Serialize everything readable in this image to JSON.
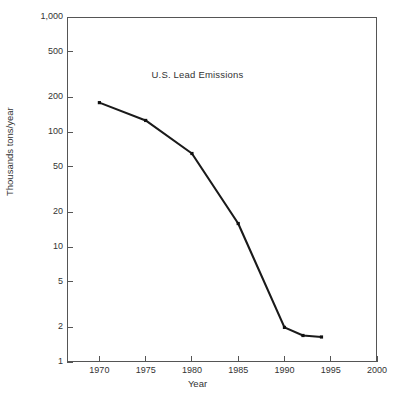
{
  "chart_data": {
    "type": "line",
    "title": "U.S. Lead Emissions",
    "xlabel": "Year",
    "ylabel": "Thousands tons/year",
    "x": [
      1970,
      1975,
      1980,
      1985,
      1990,
      1992,
      1994
    ],
    "values": [
      180,
      126,
      65,
      16,
      2.0,
      1.7,
      1.65
    ],
    "series": [
      {
        "name": "U.S. Lead Emissions",
        "values": [
          180,
          126,
          65,
          16,
          2.0,
          1.7,
          1.65
        ]
      }
    ],
    "xlim": [
      1966.5,
      2000
    ],
    "ylim": [
      1,
      1000
    ],
    "yscale": "log",
    "xscale": "linear",
    "grid": false,
    "legend": false,
    "marker": "square",
    "line_color": "#1a1a1a",
    "xticks": [
      1970,
      1975,
      1980,
      1985,
      1990,
      1995,
      2000
    ],
    "xtick_labels": [
      "1970",
      "1975",
      "1980",
      "1985",
      "1990",
      "1995",
      "2000"
    ],
    "yticks": [
      1,
      2,
      5,
      10,
      20,
      50,
      100,
      200,
      500,
      1000
    ],
    "ytick_labels": [
      "1",
      "2",
      "5",
      "10",
      "20",
      "50",
      "100",
      "200",
      "500",
      "1,000"
    ]
  }
}
